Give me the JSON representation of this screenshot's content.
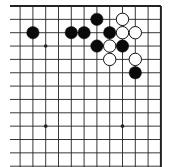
{
  "diagram": {
    "type": "go-board-corner",
    "grid": {
      "columns": 12,
      "visible_rows": 13,
      "edges": [
        "top",
        "right"
      ],
      "line_color": "#222222",
      "background": "#ffffff"
    },
    "star_points": [
      {
        "col": 3,
        "row": 3
      },
      {
        "col": 3,
        "row": 9
      },
      {
        "col": 9,
        "row": 9
      }
    ],
    "stones": [
      {
        "color": "black",
        "col": 2,
        "row": 2
      },
      {
        "color": "black",
        "col": 5,
        "row": 2
      },
      {
        "color": "black",
        "col": 6,
        "row": 2
      },
      {
        "color": "black",
        "col": 7,
        "row": 1
      },
      {
        "color": "white",
        "col": 9,
        "row": 1
      },
      {
        "color": "black",
        "col": 8,
        "row": 2
      },
      {
        "color": "white",
        "col": 9,
        "row": 2
      },
      {
        "color": "white",
        "col": 10,
        "row": 2
      },
      {
        "color": "black",
        "col": 7,
        "row": 3
      },
      {
        "color": "white",
        "col": 8,
        "row": 3
      },
      {
        "color": "black",
        "col": 9,
        "row": 3
      },
      {
        "color": "white",
        "col": 8,
        "row": 4
      },
      {
        "color": "white",
        "col": 10,
        "row": 4
      },
      {
        "color": "black",
        "col": 10,
        "row": 5
      }
    ]
  }
}
